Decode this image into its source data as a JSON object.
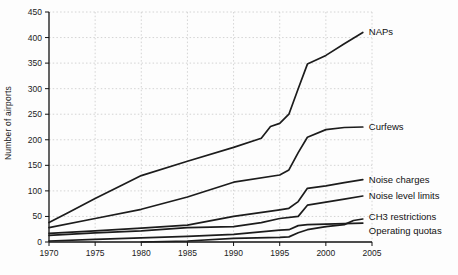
{
  "chart_data": {
    "type": "line",
    "title": "",
    "xlabel": "",
    "ylabel": "Number of airports",
    "xlim": [
      1970,
      2005
    ],
    "ylim": [
      0,
      450
    ],
    "xticks": [
      1970,
      1975,
      1980,
      1985,
      1990,
      1995,
      2000,
      2005
    ],
    "yticks": [
      0,
      50,
      100,
      150,
      200,
      250,
      300,
      350,
      400,
      450
    ],
    "grid": "dotted both axes",
    "legend_position": "labels at right end of each line",
    "line_color": "#1c1c1c",
    "grid_color": "#c9c9c9",
    "axis_color": "#111111",
    "series": [
      {
        "name": "NAPs",
        "label_dy": 0,
        "points": [
          [
            1970,
            38
          ],
          [
            1972,
            57
          ],
          [
            1975,
            85
          ],
          [
            1978,
            112
          ],
          [
            1980,
            130
          ],
          [
            1985,
            158
          ],
          [
            1990,
            185
          ],
          [
            1993,
            203
          ],
          [
            1994,
            226
          ],
          [
            1995,
            232
          ],
          [
            1996,
            250
          ],
          [
            1997,
            300
          ],
          [
            1998,
            348
          ],
          [
            2000,
            365
          ],
          [
            2002,
            388
          ],
          [
            2004,
            410
          ]
        ]
      },
      {
        "name": "Curfews",
        "label_dy": 0,
        "points": [
          [
            1970,
            28
          ],
          [
            1975,
            46
          ],
          [
            1980,
            64
          ],
          [
            1985,
            88
          ],
          [
            1990,
            117
          ],
          [
            1995,
            131
          ],
          [
            1996,
            141
          ],
          [
            1997,
            175
          ],
          [
            1998,
            205
          ],
          [
            2000,
            220
          ],
          [
            2002,
            224
          ],
          [
            2004,
            225
          ]
        ]
      },
      {
        "name": "Noise charges",
        "label_dy": 0,
        "points": [
          [
            1970,
            17
          ],
          [
            1975,
            22
          ],
          [
            1980,
            27
          ],
          [
            1985,
            33
          ],
          [
            1990,
            50
          ],
          [
            1995,
            63
          ],
          [
            1996,
            66
          ],
          [
            1997,
            79
          ],
          [
            1998,
            105
          ],
          [
            2000,
            110
          ],
          [
            2002,
            116
          ],
          [
            2004,
            122
          ]
        ]
      },
      {
        "name": "Noise level limits",
        "label_dy": 0,
        "points": [
          [
            1970,
            13
          ],
          [
            1975,
            18
          ],
          [
            1980,
            22
          ],
          [
            1985,
            28
          ],
          [
            1990,
            30
          ],
          [
            1993,
            38
          ],
          [
            1995,
            46
          ],
          [
            1997,
            50
          ],
          [
            1998,
            72
          ],
          [
            2000,
            78
          ],
          [
            2002,
            84
          ],
          [
            2004,
            90
          ]
        ]
      },
      {
        "name": "CH3 restrictions",
        "label_dy": -2,
        "points": [
          [
            1980,
            0
          ],
          [
            1985,
            2
          ],
          [
            1990,
            7
          ],
          [
            1995,
            9
          ],
          [
            1996,
            10
          ],
          [
            1997,
            18
          ],
          [
            1998,
            24
          ],
          [
            2000,
            30
          ],
          [
            2002,
            34
          ],
          [
            2003,
            42
          ],
          [
            2004,
            45
          ]
        ]
      },
      {
        "name": "Operating quotas",
        "label_dy": 8,
        "points": [
          [
            1970,
            2
          ],
          [
            1975,
            5
          ],
          [
            1980,
            8
          ],
          [
            1985,
            11
          ],
          [
            1990,
            15
          ],
          [
            1995,
            23
          ],
          [
            1996,
            24
          ],
          [
            1997,
            32
          ],
          [
            1998,
            34
          ],
          [
            2000,
            35
          ],
          [
            2002,
            36
          ],
          [
            2004,
            37
          ]
        ]
      }
    ]
  }
}
